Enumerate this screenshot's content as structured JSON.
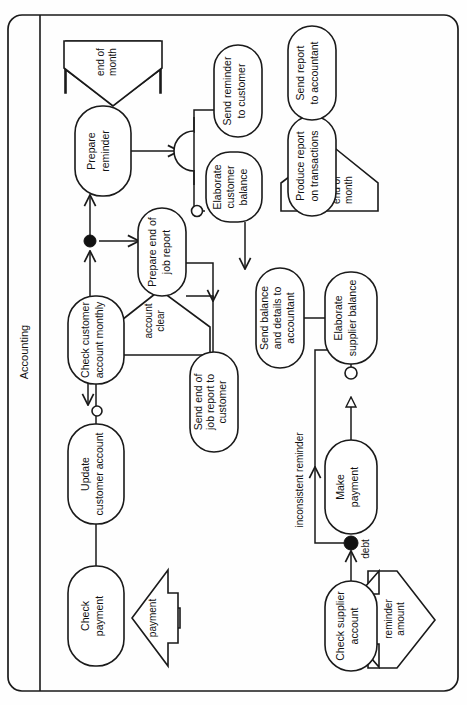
{
  "diagram": {
    "kind": "uml-activity-diagram",
    "orientation": "rotated-90-ccw",
    "canvas": {
      "width": 467,
      "height": 705
    },
    "swimlane": {
      "label": "Accounting"
    },
    "activities": [
      {
        "id": "check-payment",
        "label_lines": [
          "Check",
          "payment"
        ]
      },
      {
        "id": "update-customer",
        "label_lines": [
          "Update",
          "customer account"
        ]
      },
      {
        "id": "check-customer",
        "label_lines": [
          "Check customer",
          "account monthly"
        ]
      },
      {
        "id": "prepare-reminder",
        "label_lines": [
          "Prepare",
          "reminder"
        ]
      },
      {
        "id": "prepare-end-job",
        "label_lines": [
          "Prepare end of",
          "job report"
        ]
      },
      {
        "id": "send-end-job",
        "label_lines": [
          "Send end of",
          "job report to",
          "customer"
        ]
      },
      {
        "id": "send-reminder",
        "label_lines": [
          "Send reminder",
          "to customer"
        ]
      },
      {
        "id": "elaborate-customer",
        "label_lines": [
          "Elaborate",
          "customer",
          "balance"
        ]
      },
      {
        "id": "send-balance",
        "label_lines": [
          "Send balance",
          "and details to",
          "accountant"
        ]
      },
      {
        "id": "produce-report",
        "label_lines": [
          "Produce report",
          "on transactions"
        ]
      },
      {
        "id": "send-report",
        "label_lines": [
          "Send report",
          "to accountant"
        ]
      },
      {
        "id": "elaborate-supplier",
        "label_lines": [
          "Elaborate",
          "supplier balance"
        ]
      },
      {
        "id": "make-payment",
        "label_lines": [
          "Make",
          "payment"
        ]
      },
      {
        "id": "check-supplier",
        "label_lines": [
          "Check supplier",
          "account"
        ]
      }
    ],
    "signals": [
      {
        "id": "sig-payment",
        "label_lines": [
          "payment"
        ]
      },
      {
        "id": "sig-end-of-month-1",
        "label_lines": [
          "end of",
          "month"
        ]
      },
      {
        "id": "sig-account-clear",
        "label_lines": [
          "account",
          "clear"
        ]
      },
      {
        "id": "sig-end-of-month-2",
        "label_lines": [
          "end of",
          "month"
        ]
      },
      {
        "id": "sig-reminder-amount",
        "label_lines": [
          "reminder",
          "amount"
        ]
      }
    ],
    "edge_labels": [
      {
        "id": "lbl-debt",
        "text": "debt"
      },
      {
        "id": "lbl-inconsistent-reminder",
        "text": "inconsistent reminder"
      }
    ],
    "colors": {
      "stroke": "#1a1a1a",
      "fill": "#ffffff",
      "junction": "#111111",
      "background": "#fefefe"
    }
  }
}
